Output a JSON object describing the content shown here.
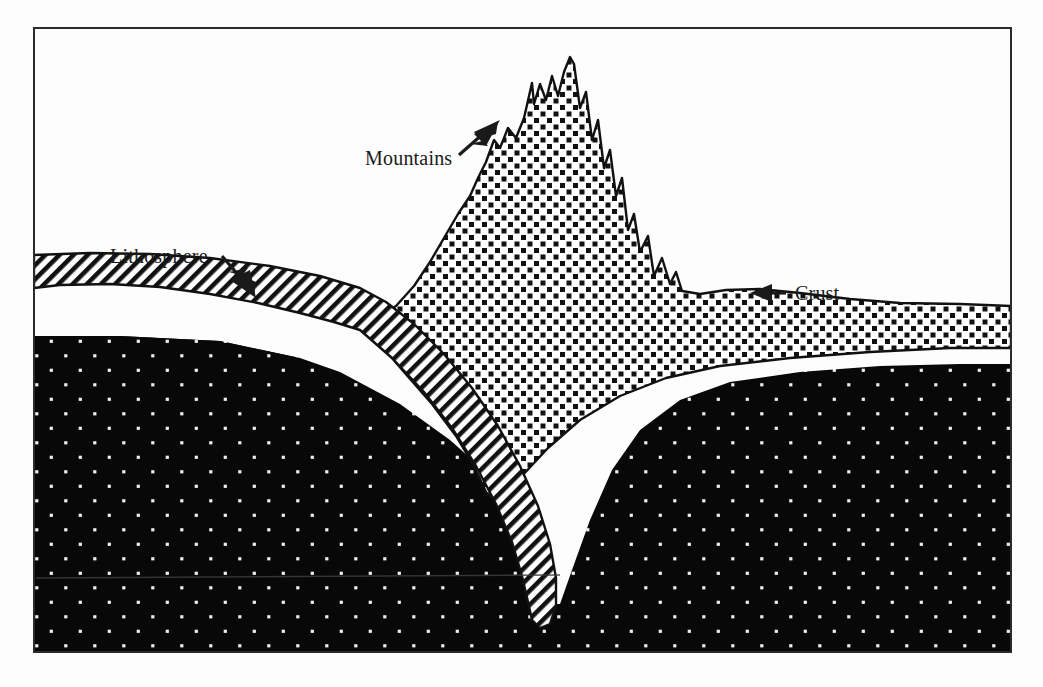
{
  "figure": {
    "background_color": "#fdfdfd",
    "ink_color": "#1a1a1a",
    "frame": {
      "name": "diagram-border",
      "x": 33,
      "y": 27,
      "width": 979,
      "height": 626,
      "stroke": "#2b2b2b",
      "stroke_width": 2
    }
  },
  "labels": [
    {
      "id": "lithosphere",
      "text": "Lithosphere",
      "x": 110,
      "y": 263,
      "arrow": {
        "from_x": 222,
        "from_y": 258,
        "to_x": 252,
        "to_y": 292
      }
    },
    {
      "id": "mountains",
      "text": "Mountains",
      "x": 365,
      "y": 165,
      "arrow": {
        "from_x": 459,
        "from_y": 153,
        "to_x": 500,
        "to_y": 124
      }
    },
    {
      "id": "crust",
      "text": "Crust",
      "x": 795,
      "y": 300,
      "arrow": {
        "from_x": 787,
        "from_y": 293,
        "to_x": 752,
        "to_y": 293
      }
    }
  ],
  "layers": [
    {
      "id": "mantle",
      "name": "mantle",
      "texture": "white-dots-on-black",
      "fill_color": "#080808",
      "dot_color": "#f2f2f2",
      "dot_spacing": 29,
      "dot_radius": 1.8
    },
    {
      "id": "crust",
      "name": "crust",
      "texture": "black-squares-on-white",
      "fill_color": "#ffffff",
      "mark_color": "#111111",
      "mark_size": 5,
      "spacing": 13
    },
    {
      "id": "lithosphere",
      "name": "lithosphere-slab",
      "texture": "diagonal-hatch",
      "fill_color": "#ffffff",
      "line_color": "#111111",
      "line_spacing": 7,
      "line_width": 2.6,
      "angle_deg": 45
    }
  ],
  "artifacts": {
    "scan_line": {
      "name": "scan-artifact-line",
      "x1": 36,
      "y1": 578,
      "x2": 560,
      "y2": 575,
      "color": "#3a3a3a"
    }
  }
}
